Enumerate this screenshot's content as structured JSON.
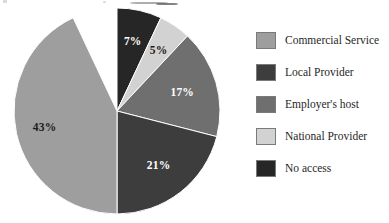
{
  "chart_data": {
    "type": "pie",
    "title": "",
    "subtitle": "",
    "xlabel": "",
    "ylabel": "",
    "grid": false,
    "legend_position": "right",
    "start_angle_deg": 0,
    "direction": "clockwise",
    "categories": [
      "No access",
      "National Provider",
      "Employer's host",
      "Local Provider",
      "Commercial Service"
    ],
    "values": [
      7,
      5,
      17,
      21,
      43
    ],
    "value_unit": "%",
    "data_labels": [
      "7%",
      "5%",
      "17%",
      "21%",
      "43%"
    ],
    "colors": [
      "#262626",
      "#d2d2d2",
      "#6f6f6f",
      "#3d3d3d",
      "#9e9e9e"
    ],
    "slices": [
      {
        "name": "No access",
        "value": 7,
        "label": "7%",
        "color": "#262626",
        "label_color": "#ffffff",
        "legend_index": 4,
        "start_deg": 0,
        "end_deg": 25.2
      },
      {
        "name": "National Provider",
        "value": 5,
        "label": "5%",
        "color": "#d2d2d2",
        "label_color": "#1c1c1c",
        "legend_index": 3,
        "start_deg": 25.2,
        "end_deg": 43.2
      },
      {
        "name": "Employer's host",
        "value": 17,
        "label": "17%",
        "color": "#6f6f6f",
        "label_color": "#ffffff",
        "legend_index": 2,
        "start_deg": 43.2,
        "end_deg": 104.4
      },
      {
        "name": "Local Provider",
        "value": 21,
        "label": "21%",
        "color": "#3d3d3d",
        "label_color": "#ffffff",
        "legend_index": 1,
        "start_deg": 104.4,
        "end_deg": 180.0
      },
      {
        "name": "Commercial Service",
        "value": 43,
        "label": "43%",
        "color": "#9e9e9e",
        "label_color": "#1c1c1c",
        "legend_index": 0,
        "start_deg": 180.0,
        "end_deg": 334.8
      }
    ]
  },
  "pie": {
    "center_x": 105,
    "center_y": 105,
    "radius": 103,
    "labels": {
      "no_access": "7%",
      "national_provider": "5%",
      "employers_host": "17%",
      "local_provider": "21%",
      "commercial_service": "43%"
    }
  },
  "legend": {
    "items": [
      {
        "label": "Commercial Service",
        "color": "#9e9e9e"
      },
      {
        "label": "Local Provider",
        "color": "#3d3d3d"
      },
      {
        "label": "Employer's host",
        "color": "#6f6f6f"
      },
      {
        "label": "National Provider",
        "color": "#d2d2d2"
      },
      {
        "label": "No access",
        "color": "#262626"
      }
    ]
  }
}
